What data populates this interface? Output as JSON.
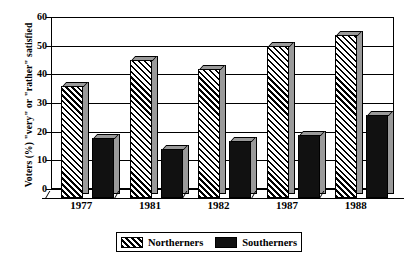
{
  "chart_data": {
    "type": "bar",
    "title": "",
    "xlabel": "",
    "ylabel": "Voters (%) \"very\" or \"rather\" satisfied",
    "categories": [
      "1977",
      "1981",
      "1982",
      "1987",
      "1988"
    ],
    "series": [
      {
        "name": "Northerners",
        "values": [
          39,
          48,
          45,
          53,
          57
        ],
        "fill": "diagonal-hatch"
      },
      {
        "name": "Southerners",
        "values": [
          21,
          17,
          20,
          22,
          29
        ],
        "fill": "solid-black"
      }
    ],
    "ylim": [
      0,
      60
    ],
    "yticks": [
      0,
      10,
      20,
      30,
      40,
      50,
      60
    ],
    "grid": true,
    "legend_position": "bottom",
    "style": "3d-column"
  },
  "legend": {
    "items": [
      {
        "label": "Northerners"
      },
      {
        "label": "Southerners"
      }
    ]
  },
  "colors": {
    "series_northerners": "#000000",
    "series_southerners": "#111111",
    "axis": "#000000",
    "background": "#ffffff",
    "bar_side_shade": "#9a9a9a"
  }
}
